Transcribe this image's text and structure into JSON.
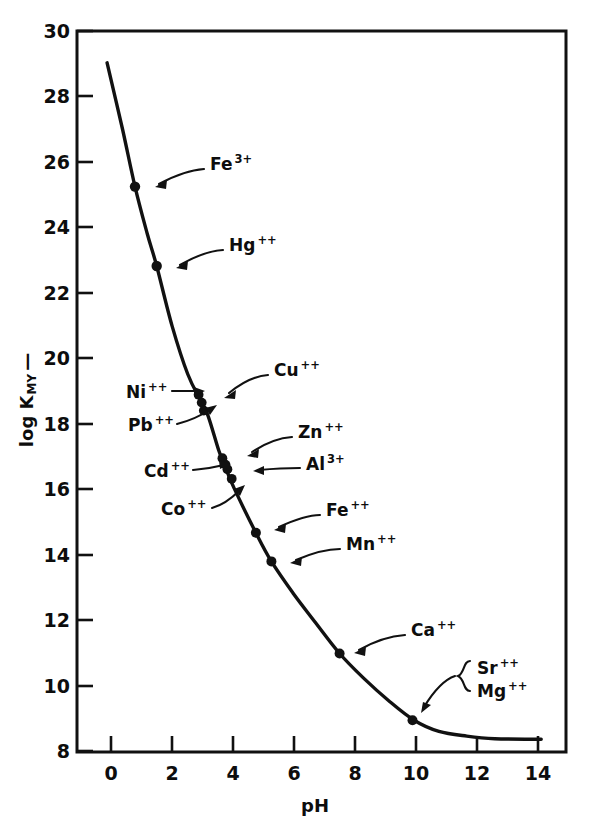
{
  "chart_data": {
    "type": "line",
    "title": "",
    "xlabel": "pH",
    "ylabel": "log Kₘᵧ—",
    "ylabel_text": "log K",
    "ylabel_sub": "MY",
    "ylabel_dash": "—",
    "xlim": [
      -0.67,
      15.1
    ],
    "ylim": [
      7.3,
      30.0
    ],
    "xticks": [
      0,
      2,
      4,
      6,
      8,
      10,
      12,
      14
    ],
    "xtick_labels": [
      "0",
      "2",
      "4",
      "6",
      "8",
      "10",
      "12",
      "14"
    ],
    "yticks": [
      8,
      10,
      12,
      14,
      16,
      18,
      20,
      22,
      24,
      26,
      28,
      30
    ],
    "ytick_labels": [
      "8",
      "10",
      "12",
      "14",
      "16",
      "18",
      "20",
      "22",
      "24",
      "26",
      "28",
      "30"
    ],
    "grid": false,
    "legend": "none",
    "series": [
      {
        "name": "log K_MY vs pH",
        "x": [
          0.3,
          0.8,
          1.2,
          1.6,
          1.9,
          2.4,
          2.9,
          3.3,
          3.55,
          3.9,
          4.1,
          4.4,
          5.1,
          5.6,
          6.3,
          7.0,
          7.8,
          8.6,
          9.4,
          10.2,
          11.0,
          11.9,
          12.8,
          14.3
        ],
        "y": [
          29.0,
          26.9,
          25.1,
          23.6,
          22.6,
          20.7,
          19.2,
          18.4,
          17.9,
          16.8,
          16.3,
          15.6,
          14.2,
          13.3,
          12.3,
          11.4,
          10.4,
          9.6,
          8.9,
          8.3,
          7.95,
          7.8,
          7.72,
          7.7
        ]
      }
    ],
    "points": [
      {
        "label": "Fe",
        "charge": "3+",
        "ph": 1.2,
        "logk": 25.1
      },
      {
        "label": "Hg",
        "charge": "++",
        "ph": 1.9,
        "logk": 22.6
      },
      {
        "label": "Ni",
        "charge": "++",
        "ph": 3.25,
        "logk": 18.55
      },
      {
        "label": "Cu",
        "charge": "++",
        "ph": 3.35,
        "logk": 18.3
      },
      {
        "label": "Pb",
        "charge": "++",
        "ph": 3.42,
        "logk": 18.05
      },
      {
        "label": "Zn",
        "charge": "++",
        "ph": 4.02,
        "logk": 16.55
      },
      {
        "label": "Cd",
        "charge": "++",
        "ph": 4.12,
        "logk": 16.35
      },
      {
        "label": "Al",
        "charge": "3+",
        "ph": 4.18,
        "logk": 16.2
      },
      {
        "label": "Co",
        "charge": "++",
        "ph": 4.32,
        "logk": 15.9
      },
      {
        "label": "Fe",
        "charge": "++",
        "ph": 5.1,
        "logk": 14.2
      },
      {
        "label": "Mn",
        "charge": "++",
        "ph": 5.6,
        "logk": 13.3
      },
      {
        "label": "Ca",
        "charge": "++",
        "ph": 7.8,
        "logk": 10.4
      },
      {
        "label": "Sr",
        "charge": "++",
        "ph": 10.15,
        "logk": 8.3
      },
      {
        "label": "Mg",
        "charge": "++",
        "ph": 10.15,
        "logk": 8.3
      }
    ],
    "annotations": [
      {
        "name": "Fe3",
        "base": "Fe",
        "sup": "3+"
      },
      {
        "name": "Hg",
        "base": "Hg",
        "sup": "++"
      },
      {
        "name": "Ni",
        "base": "Ni",
        "sup": "++"
      },
      {
        "name": "Cu",
        "base": "Cu",
        "sup": "++"
      },
      {
        "name": "Pb",
        "base": "Pb",
        "sup": "++"
      },
      {
        "name": "Zn",
        "base": "Zn",
        "sup": "++"
      },
      {
        "name": "Cd",
        "base": "Cd",
        "sup": "++"
      },
      {
        "name": "Al",
        "base": "Al",
        "sup": "3+"
      },
      {
        "name": "Co",
        "base": "Co",
        "sup": "++"
      },
      {
        "name": "Fe2",
        "base": "Fe",
        "sup": "++"
      },
      {
        "name": "Mn",
        "base": "Mn",
        "sup": "++"
      },
      {
        "name": "Ca",
        "base": "Ca",
        "sup": "++"
      },
      {
        "name": "Sr",
        "base": "Sr",
        "sup": "++"
      },
      {
        "name": "Mg",
        "base": "Mg",
        "sup": "++"
      }
    ]
  },
  "axis": {
    "x_title": "pH",
    "y_title_main": "log K",
    "y_title_sub": "MY",
    "y_title_tail": "—"
  },
  "ticks": {
    "x": [
      "0",
      "2",
      "4",
      "6",
      "8",
      "10",
      "12",
      "14"
    ],
    "y": [
      "30",
      "28",
      "26",
      "24",
      "22",
      "20",
      "18",
      "16",
      "14",
      "12",
      "10",
      "8"
    ]
  },
  "labels": {
    "fe3_base": "Fe",
    "fe3_sup": "3+",
    "hg_base": "Hg",
    "hg_sup": "++",
    "ni_base": "Ni",
    "ni_sup": "++",
    "cu_base": "Cu",
    "cu_sup": "++",
    "pb_base": "Pb",
    "pb_sup": "++",
    "zn_base": "Zn",
    "zn_sup": "++",
    "cd_base": "Cd",
    "cd_sup": "++",
    "al_base": "Al",
    "al_sup": "3+",
    "co_base": "Co",
    "co_sup": "++",
    "fe2_base": "Fe",
    "fe2_sup": "++",
    "mn_base": "Mn",
    "mn_sup": "++",
    "ca_base": "Ca",
    "ca_sup": "++",
    "sr_base": "Sr",
    "sr_sup": "++",
    "mg_base": "Mg",
    "mg_sup": "++"
  },
  "colors": {
    "ink": "#111111",
    "background": "#ffffff"
  }
}
